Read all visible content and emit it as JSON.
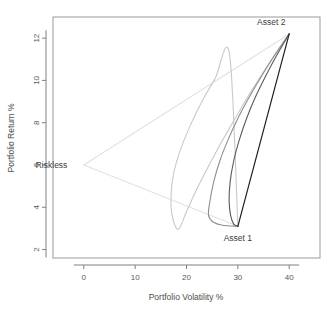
{
  "chart_data": {
    "type": "line",
    "title": "",
    "xlabel": "Portfolio Volatility %",
    "ylabel": "Portfolio Return %",
    "xlim": [
      -6,
      46
    ],
    "ylim": [
      1.6,
      13.0
    ],
    "xticks": [
      0,
      10,
      20,
      30,
      40
    ],
    "xtick_labels": [
      "0",
      "10",
      "20",
      "30",
      "40"
    ],
    "yticks": [
      2,
      4,
      6,
      8,
      10,
      12
    ],
    "ytick_labels": [
      "2",
      "4",
      "6",
      "8",
      "10",
      "12"
    ],
    "grid": false,
    "legend": false,
    "annotations": [
      {
        "name": "asset-2",
        "text": "Asset 2",
        "x": 40.0,
        "y": 12.2,
        "label_x": 36.5,
        "label_y": 12.75
      },
      {
        "name": "asset-1",
        "text": "Asset 1",
        "x": 30.0,
        "y": 3.1,
        "label_x": 30.0,
        "label_y": 2.55
      },
      {
        "name": "riskless",
        "text": "Riskless",
        "x": 0.0,
        "y": 6.0,
        "label_x": -3.2,
        "label_y": 6.0
      }
    ],
    "endpoints": {
      "asset_1": {
        "volatility": 30.0,
        "return": 3.1
      },
      "asset_2": {
        "volatility": 40.0,
        "return": 12.2
      },
      "riskless": {
        "volatility": 0.0,
        "return": 6.0
      }
    },
    "series": [
      {
        "name": "frontier-rho--1.0",
        "correlation": -1.0,
        "color": "#c9c9c9",
        "width": 1.1,
        "points": [
          [
            40.0,
            12.2
          ],
          [
            37.0,
            11.15
          ],
          [
            34.2,
            10.1
          ],
          [
            31.5,
            9.05
          ],
          [
            29.0,
            8.0
          ],
          [
            26.5,
            6.95
          ],
          [
            24.2,
            5.9
          ],
          [
            22.0,
            4.85
          ],
          [
            20.0,
            3.8
          ],
          [
            18.4,
            2.95
          ],
          [
            17.2,
            3.6
          ],
          [
            17.0,
            4.6
          ],
          [
            17.5,
            5.6
          ],
          [
            18.8,
            6.7
          ],
          [
            20.7,
            7.85
          ],
          [
            23.0,
            9.0
          ],
          [
            25.6,
            10.1
          ],
          [
            28.4,
            11.2
          ],
          [
            30.0,
            3.1
          ]
        ]
      },
      {
        "name": "frontier-rho--0.3",
        "correlation": -0.3,
        "color": "#8e8e8e",
        "width": 1.1,
        "points": [
          [
            40.0,
            12.2
          ],
          [
            37.2,
            11.2
          ],
          [
            34.6,
            10.2
          ],
          [
            32.2,
            9.2
          ],
          [
            30.0,
            8.2
          ],
          [
            28.1,
            7.2
          ],
          [
            26.5,
            6.2
          ],
          [
            25.3,
            5.2
          ],
          [
            24.5,
            4.2
          ],
          [
            24.3,
            3.6
          ],
          [
            25.2,
            3.3
          ],
          [
            27.0,
            3.15
          ],
          [
            30.0,
            3.1
          ]
        ]
      },
      {
        "name": "frontier-rho-0.3",
        "correlation": 0.3,
        "color": "#5a5a5a",
        "width": 1.1,
        "points": [
          [
            40.0,
            12.2
          ],
          [
            37.6,
            11.2
          ],
          [
            35.4,
            10.2
          ],
          [
            33.4,
            9.2
          ],
          [
            31.7,
            8.2
          ],
          [
            30.3,
            7.2
          ],
          [
            29.2,
            6.2
          ],
          [
            28.5,
            5.2
          ],
          [
            28.3,
            4.3
          ],
          [
            28.6,
            3.6
          ],
          [
            29.2,
            3.2
          ],
          [
            30.0,
            3.1
          ]
        ]
      },
      {
        "name": "frontier-rho-1.0",
        "correlation": 1.0,
        "color": "#1f1f1f",
        "width": 1.2,
        "points": [
          [
            40.0,
            12.2
          ],
          [
            38.0,
            10.38
          ],
          [
            36.0,
            8.56
          ],
          [
            34.0,
            6.74
          ],
          [
            32.0,
            4.92
          ],
          [
            30.0,
            3.1
          ]
        ]
      }
    ],
    "riskless_lines": [
      {
        "name": "riskless-to-asset-2",
        "color": "#e2e2e2",
        "width": 1.1,
        "points": [
          [
            0.0,
            6.0
          ],
          [
            40.0,
            12.2
          ]
        ]
      },
      {
        "name": "riskless-to-asset-1",
        "color": "#e2e2e2",
        "width": 1.1,
        "points": [
          [
            0.0,
            6.0
          ],
          [
            30.0,
            3.1
          ]
        ]
      }
    ]
  }
}
